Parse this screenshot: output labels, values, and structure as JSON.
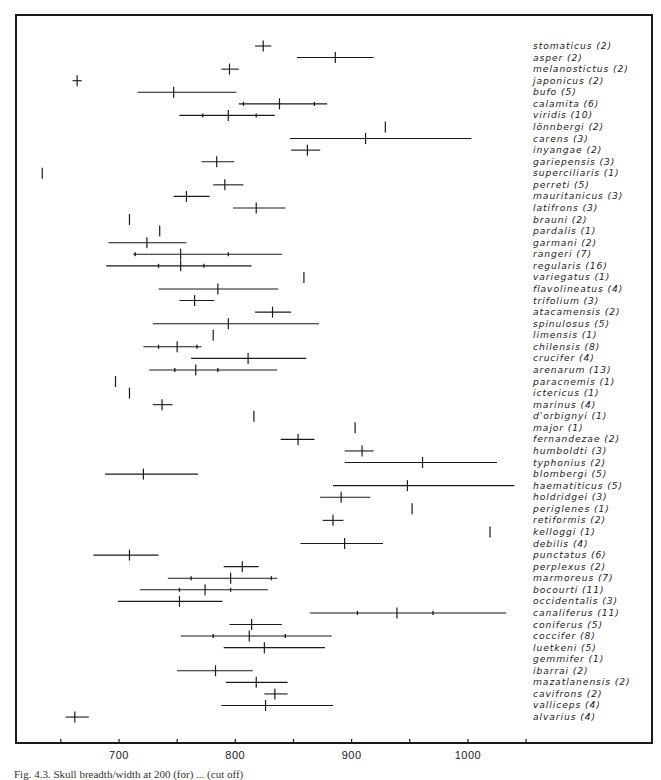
{
  "chart_data": {
    "type": "range-plot",
    "title": "",
    "xlabel": "",
    "ylabel": "",
    "xlim": [
      630,
      1090
    ],
    "x_ticks": [
      650,
      700,
      750,
      800,
      850,
      900,
      950,
      1000,
      1050
    ],
    "x_tick_labels": [
      {
        "value": 700,
        "label": "700"
      },
      {
        "value": 800,
        "label": "800"
      },
      {
        "value": 900,
        "label": "900"
      },
      {
        "value": 1000,
        "label": "1000"
      }
    ],
    "grid": false,
    "legend": "none",
    "series": [
      {
        "species": "stomaticus",
        "n": 2,
        "label": "stomaticus (2)",
        "min": 817,
        "max": 831,
        "mean": 824,
        "inner": []
      },
      {
        "species": "asper",
        "n": 2,
        "label": "asper (2)",
        "min": 853,
        "max": 919,
        "mean": 886,
        "inner": []
      },
      {
        "species": "melanostictus",
        "n": 2,
        "label": "melanostictus (2)",
        "min": 788,
        "max": 803,
        "mean": 795,
        "inner": []
      },
      {
        "species": "japonicus",
        "n": 2,
        "label": "japonicus (2)",
        "min": 660,
        "max": 668,
        "mean": 664,
        "inner": []
      },
      {
        "species": "bufo",
        "n": 5,
        "label": "bufo (5)",
        "min": 716,
        "max": 801,
        "mean": 747,
        "inner": []
      },
      {
        "species": "calamita",
        "n": 6,
        "label": "calamita (6)",
        "min": 803,
        "max": 879,
        "mean": 838,
        "inner": [
          807,
          868
        ]
      },
      {
        "species": "viridis",
        "n": 10,
        "label": "viridis (10)",
        "min": 752,
        "max": 834,
        "mean": 794,
        "inner": [
          772,
          818
        ]
      },
      {
        "species": "lönnbergi",
        "n": 2,
        "label": "lönnbergi (2)",
        "min": null,
        "max": null,
        "mean": 929,
        "inner": []
      },
      {
        "species": "carens",
        "n": 3,
        "label": "carens (3)",
        "min": 847,
        "max": 1003,
        "mean": 912,
        "inner": []
      },
      {
        "species": "inyangae",
        "n": 2,
        "label": "inyangae (2)",
        "min": 848,
        "max": 873,
        "mean": 862,
        "inner": []
      },
      {
        "species": "gariepensis",
        "n": 3,
        "label": "gariepensis (3)",
        "min": 771,
        "max": 799,
        "mean": 784,
        "inner": []
      },
      {
        "species": "superciliaris",
        "n": 1,
        "label": "superciliaris (1)",
        "min": null,
        "max": null,
        "mean": 634,
        "inner": []
      },
      {
        "species": "perreti",
        "n": 5,
        "label": "perreti (5)",
        "min": 781,
        "max": 807,
        "mean": 791,
        "inner": []
      },
      {
        "species": "mauritanicus",
        "n": 3,
        "label": "mauritanicus (3)",
        "min": 747,
        "max": 778,
        "mean": 758,
        "inner": []
      },
      {
        "species": "latifrons",
        "n": 3,
        "label": "latifrons (3)",
        "min": 798,
        "max": 843,
        "mean": 818,
        "inner": []
      },
      {
        "species": "brauni",
        "n": 2,
        "label": "brauni (2)",
        "min": null,
        "max": null,
        "mean": 709,
        "inner": []
      },
      {
        "species": "pardalis",
        "n": 1,
        "label": "pardalis (1)",
        "min": null,
        "max": null,
        "mean": 735,
        "inner": []
      },
      {
        "species": "garmani",
        "n": 2,
        "label": "garmani (2)",
        "min": 691,
        "max": 758,
        "mean": 724,
        "inner": []
      },
      {
        "species": "rangeri",
        "n": 7,
        "label": "rangeri (7)",
        "min": 712,
        "max": 840,
        "mean": 753,
        "inner": [
          714,
          794
        ]
      },
      {
        "species": "regularis",
        "n": 16,
        "label": "regularis (16)",
        "min": 689,
        "max": 814,
        "mean": 753,
        "inner": [
          734,
          773
        ]
      },
      {
        "species": "variegatus",
        "n": 1,
        "label": "variegatus (1)",
        "min": null,
        "max": null,
        "mean": 859,
        "inner": []
      },
      {
        "species": "flavolineatus",
        "n": 4,
        "label": "flavolineatus (4)",
        "min": 734,
        "max": 837,
        "mean": 785,
        "inner": []
      },
      {
        "species": "trifolium",
        "n": 3,
        "label": "trifolium (3)",
        "min": 752,
        "max": 782,
        "mean": 765,
        "inner": []
      },
      {
        "species": "atacamensis",
        "n": 2,
        "label": "atacamensis (2)",
        "min": 817,
        "max": 848,
        "mean": 832,
        "inner": []
      },
      {
        "species": "spinulosus",
        "n": 5,
        "label": "spinulosus (5)",
        "min": 729,
        "max": 872,
        "mean": 794,
        "inner": []
      },
      {
        "species": "limensis",
        "n": 1,
        "label": "limensis (1)",
        "min": null,
        "max": null,
        "mean": 781,
        "inner": []
      },
      {
        "species": "chilensis",
        "n": 8,
        "label": "chilensis (8)",
        "min": 721,
        "max": 771,
        "mean": 750,
        "inner": [
          734,
          767
        ]
      },
      {
        "species": "crucifer",
        "n": 4,
        "label": "crucifer (4)",
        "min": 762,
        "max": 861,
        "mean": 811,
        "inner": []
      },
      {
        "species": "arenarum",
        "n": 13,
        "label": "arenarum (13)",
        "min": 726,
        "max": 836,
        "mean": 766,
        "inner": [
          748,
          785
        ]
      },
      {
        "species": "paracnemis",
        "n": 1,
        "label": "paracnemis (1)",
        "min": null,
        "max": null,
        "mean": 697,
        "inner": []
      },
      {
        "species": "ictericus",
        "n": 1,
        "label": "ictericus (1)",
        "min": null,
        "max": null,
        "mean": 709,
        "inner": []
      },
      {
        "species": "marinus",
        "n": 4,
        "label": "marinus (4)",
        "min": 729,
        "max": 746,
        "mean": 737,
        "inner": []
      },
      {
        "species": "d'orbignyi",
        "n": 1,
        "label": "d'orbignyi (1)",
        "min": null,
        "max": null,
        "mean": 816,
        "inner": []
      },
      {
        "species": "major",
        "n": 1,
        "label": "major (1)",
        "min": null,
        "max": null,
        "mean": 903,
        "inner": []
      },
      {
        "species": "fernandezae",
        "n": 2,
        "label": "fernandezae (2)",
        "min": 839,
        "max": 868,
        "mean": 854,
        "inner": []
      },
      {
        "species": "humboldti",
        "n": 3,
        "label": "humboldti (3)",
        "min": 894,
        "max": 919,
        "mean": 909,
        "inner": []
      },
      {
        "species": "typhonius",
        "n": 2,
        "label": "typhonius (2)",
        "min": 894,
        "max": 1025,
        "mean": 961,
        "inner": []
      },
      {
        "species": "blombergi",
        "n": 5,
        "label": "blombergi (5)",
        "min": 688,
        "max": 768,
        "mean": 721,
        "inner": []
      },
      {
        "species": "haematiticus",
        "n": 5,
        "label": "haematiticus (5)",
        "min": 884,
        "max": 1040,
        "mean": 948,
        "inner": []
      },
      {
        "species": "holdridgei",
        "n": 3,
        "label": "holdridgei (3)",
        "min": 873,
        "max": 916,
        "mean": 891,
        "inner": []
      },
      {
        "species": "periglenes",
        "n": 1,
        "label": "periglenes (1)",
        "min": null,
        "max": null,
        "mean": 952,
        "inner": []
      },
      {
        "species": "retiformis",
        "n": 2,
        "label": "retiformis (2)",
        "min": 875,
        "max": 893,
        "mean": 884,
        "inner": []
      },
      {
        "species": "kelloggi",
        "n": 1,
        "label": "kelloggi (1)",
        "min": null,
        "max": null,
        "mean": 1019,
        "inner": []
      },
      {
        "species": "debilis",
        "n": 4,
        "label": "debilis (4)",
        "min": 856,
        "max": 927,
        "mean": 894,
        "inner": []
      },
      {
        "species": "punctatus",
        "n": 6,
        "label": "punctatus (6)",
        "min": 678,
        "max": 734,
        "mean": 709,
        "inner": []
      },
      {
        "species": "perplexus",
        "n": 2,
        "label": "perplexus (2)",
        "min": 790,
        "max": 820,
        "mean": 806,
        "inner": []
      },
      {
        "species": "marmoreus",
        "n": 7,
        "label": "marmoreus (7)",
        "min": 742,
        "max": 836,
        "mean": 796,
        "inner": [
          762,
          831
        ]
      },
      {
        "species": "bocourti",
        "n": 11,
        "label": "bocourti (11)",
        "min": 718,
        "max": 828,
        "mean": 774,
        "inner": [
          752,
          796
        ]
      },
      {
        "species": "occidentalis",
        "n": 3,
        "label": "occidentalis (3)",
        "min": 699,
        "max": 789,
        "mean": 752,
        "inner": []
      },
      {
        "species": "canaliferus",
        "n": 11,
        "label": "canaliferus (11)",
        "min": 864,
        "max": 1033,
        "mean": 939,
        "inner": [
          905,
          970
        ]
      },
      {
        "species": "coniferus",
        "n": 5,
        "label": "coniferus (5)",
        "min": 795,
        "max": 840,
        "mean": 814,
        "inner": []
      },
      {
        "species": "coccifer",
        "n": 8,
        "label": "coccifer (8)",
        "min": 753,
        "max": 883,
        "mean": 812,
        "inner": [
          781,
          843
        ]
      },
      {
        "species": "luetkeni",
        "n": 5,
        "label": "luetkeni (5)",
        "min": 790,
        "max": 877,
        "mean": 825,
        "inner": []
      },
      {
        "species": "gemmifer",
        "n": 1,
        "label": "gemmifer (1)",
        "min": null,
        "max": null,
        "mean": null,
        "inner": []
      },
      {
        "species": "ibarrai",
        "n": 2,
        "label": "ibarrai (2)",
        "min": 750,
        "max": 815,
        "mean": 783,
        "inner": []
      },
      {
        "species": "mazatlanensis",
        "n": 2,
        "label": "mazatlanensis (2)",
        "min": 792,
        "max": 845,
        "mean": 818,
        "inner": []
      },
      {
        "species": "cavifrons",
        "n": 2,
        "label": "cavifrons (2)",
        "min": 825,
        "max": 845,
        "mean": 834,
        "inner": []
      },
      {
        "species": "valliceps",
        "n": 4,
        "label": "valliceps (4)",
        "min": 788,
        "max": 884,
        "mean": 826,
        "inner": []
      },
      {
        "species": "alvarius",
        "n": 4,
        "label": "alvarius (4)",
        "min": 654,
        "max": 674,
        "mean": 662,
        "inner": []
      }
    ]
  },
  "caption": "Fig. 4.3. Skull breadth/width at 200 (for) ... (cut off)",
  "colors": {
    "ink": "#1a1a1a",
    "background": "#ffffff"
  }
}
